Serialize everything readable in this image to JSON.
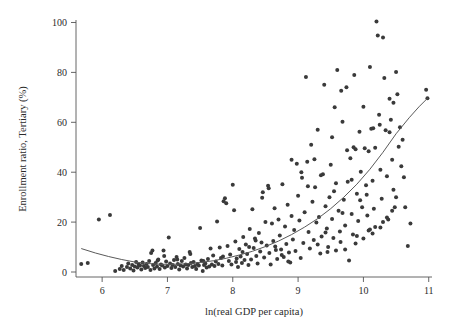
{
  "chart_data": {
    "type": "scatter",
    "title": "",
    "xlabel": "ln(real GDP per capita)",
    "ylabel": "Enrollment ratio, Tertiary (%)",
    "xlim": [
      5.6,
      11.05
    ],
    "ylim": [
      -2,
      101
    ],
    "xticks": [
      6,
      7,
      8,
      9,
      10,
      11
    ],
    "yticks": [
      0,
      20,
      40,
      60,
      80,
      100
    ],
    "xtick_labels": [
      "6",
      "7",
      "8",
      "9",
      "10",
      "11"
    ],
    "ytick_labels": [
      "0",
      "20",
      "40",
      "60",
      "80",
      "100"
    ],
    "grid": false,
    "legend": null,
    "marker_color": "#3a3a3a",
    "marker_size": 4,
    "fit_color": "#5a5a5a",
    "series": [
      {
        "name": "Countries",
        "points": [
          [
            5.68,
            3.2
          ],
          [
            5.78,
            3.6
          ],
          [
            5.95,
            21.0
          ],
          [
            6.12,
            22.8
          ],
          [
            6.2,
            0.4
          ],
          [
            6.27,
            1.2
          ],
          [
            6.3,
            2.4
          ],
          [
            6.33,
            0.8
          ],
          [
            6.38,
            2.0
          ],
          [
            6.4,
            3.4
          ],
          [
            6.43,
            1.4
          ],
          [
            6.46,
            2.8
          ],
          [
            6.48,
            0.6
          ],
          [
            6.5,
            2.2
          ],
          [
            6.52,
            4.0
          ],
          [
            6.54,
            1.8
          ],
          [
            6.56,
            3.0
          ],
          [
            6.58,
            2.6
          ],
          [
            6.6,
            1.0
          ],
          [
            6.62,
            3.8
          ],
          [
            6.64,
            2.4
          ],
          [
            6.66,
            1.6
          ],
          [
            6.68,
            3.2
          ],
          [
            6.7,
            2.0
          ],
          [
            6.72,
            4.4
          ],
          [
            6.74,
            0.8
          ],
          [
            6.75,
            7.6
          ],
          [
            6.77,
            8.6
          ],
          [
            6.78,
            2.8
          ],
          [
            6.8,
            1.4
          ],
          [
            6.82,
            3.6
          ],
          [
            6.84,
            2.2
          ],
          [
            6.86,
            5.0
          ],
          [
            6.88,
            1.2
          ],
          [
            6.9,
            3.0
          ],
          [
            6.92,
            2.6
          ],
          [
            6.94,
            8.6
          ],
          [
            6.96,
            1.8
          ],
          [
            6.98,
            4.2
          ],
          [
            7.0,
            2.4
          ],
          [
            7.02,
            13.8
          ],
          [
            7.04,
            3.4
          ],
          [
            7.06,
            1.6
          ],
          [
            7.08,
            2.8
          ],
          [
            7.1,
            4.8
          ],
          [
            7.12,
            2.0
          ],
          [
            7.14,
            6.0
          ],
          [
            7.16,
            3.2
          ],
          [
            7.18,
            1.0
          ],
          [
            7.2,
            2.6
          ],
          [
            7.22,
            4.4
          ],
          [
            7.24,
            2.2
          ],
          [
            7.26,
            5.6
          ],
          [
            7.28,
            3.0
          ],
          [
            7.3,
            1.4
          ],
          [
            7.32,
            2.8
          ],
          [
            7.34,
            8.0
          ],
          [
            7.36,
            3.6
          ],
          [
            7.38,
            2.0
          ],
          [
            7.4,
            4.0
          ],
          [
            7.42,
            2.4
          ],
          [
            7.44,
            1.2
          ],
          [
            7.46,
            3.2
          ],
          [
            7.48,
            2.6
          ],
          [
            7.5,
            17.6
          ],
          [
            7.52,
            4.6
          ],
          [
            7.54,
            0.4
          ],
          [
            7.56,
            2.8
          ],
          [
            7.58,
            3.4
          ],
          [
            7.6,
            1.8
          ],
          [
            7.62,
            5.2
          ],
          [
            7.64,
            2.2
          ],
          [
            7.66,
            9.4
          ],
          [
            7.68,
            3.0
          ],
          [
            7.7,
            6.6
          ],
          [
            7.72,
            2.4
          ],
          [
            7.74,
            4.2
          ],
          [
            7.76,
            20.2
          ],
          [
            7.78,
            3.2
          ],
          [
            7.8,
            9.8
          ],
          [
            7.82,
            5.6
          ],
          [
            7.84,
            2.6
          ],
          [
            7.86,
            28.4
          ],
          [
            7.88,
            29.6
          ],
          [
            7.9,
            27.6
          ],
          [
            7.92,
            10.4
          ],
          [
            7.94,
            4.4
          ],
          [
            7.96,
            7.0
          ],
          [
            7.98,
            3.0
          ],
          [
            8.0,
            35.0
          ],
          [
            8.02,
            24.8
          ],
          [
            8.04,
            12.2
          ],
          [
            8.06,
            5.4
          ],
          [
            8.08,
            2.0
          ],
          [
            8.1,
            9.2
          ],
          [
            8.12,
            6.2
          ],
          [
            8.14,
            3.6
          ],
          [
            8.16,
            14.0
          ],
          [
            8.18,
            4.8
          ],
          [
            8.2,
            11.0
          ],
          [
            8.22,
            7.2
          ],
          [
            8.24,
            2.8
          ],
          [
            8.26,
            17.2
          ],
          [
            8.28,
            5.0
          ],
          [
            8.3,
            25.2
          ],
          [
            8.32,
            9.6
          ],
          [
            8.34,
            13.4
          ],
          [
            8.36,
            6.4
          ],
          [
            8.38,
            3.4
          ],
          [
            8.4,
            15.6
          ],
          [
            8.42,
            8.2
          ],
          [
            8.44,
            11.8
          ],
          [
            8.46,
            32.0
          ],
          [
            8.48,
            5.8
          ],
          [
            8.5,
            20.0
          ],
          [
            8.52,
            10.6
          ],
          [
            8.54,
            34.6
          ],
          [
            8.56,
            7.6
          ],
          [
            8.58,
            3.0
          ],
          [
            8.6,
            19.4
          ],
          [
            8.62,
            12.4
          ],
          [
            8.64,
            25.6
          ],
          [
            8.66,
            8.8
          ],
          [
            8.68,
            5.2
          ],
          [
            8.7,
            21.0
          ],
          [
            8.72,
            14.6
          ],
          [
            8.74,
            9.0
          ],
          [
            8.76,
            35.2
          ],
          [
            8.78,
            6.0
          ],
          [
            8.8,
            18.2
          ],
          [
            8.82,
            11.2
          ],
          [
            8.84,
            27.0
          ],
          [
            8.86,
            7.8
          ],
          [
            8.88,
            3.8
          ],
          [
            8.9,
            22.4
          ],
          [
            8.92,
            13.0
          ],
          [
            8.94,
            16.8
          ],
          [
            8.96,
            8.4
          ],
          [
            8.98,
            43.4
          ],
          [
            9.0,
            30.6
          ],
          [
            9.02,
            20.6
          ],
          [
            9.04,
            5.6
          ],
          [
            9.06,
            37.8
          ],
          [
            9.08,
            11.6
          ],
          [
            9.1,
            24.0
          ],
          [
            9.12,
            78.2
          ],
          [
            9.14,
            44.2
          ],
          [
            9.16,
            16.0
          ],
          [
            9.18,
            9.4
          ],
          [
            9.2,
            51.0
          ],
          [
            9.22,
            28.2
          ],
          [
            9.24,
            12.8
          ],
          [
            9.26,
            34.0
          ],
          [
            9.28,
            19.8
          ],
          [
            9.3,
            57.0
          ],
          [
            9.32,
            22.0
          ],
          [
            9.34,
            7.4
          ],
          [
            9.36,
            14.2
          ],
          [
            9.38,
            39.2
          ],
          [
            9.4,
            75.0
          ],
          [
            9.42,
            26.4
          ],
          [
            9.44,
            17.4
          ],
          [
            9.46,
            10.0
          ],
          [
            9.48,
            30.0
          ],
          [
            9.5,
            43.0
          ],
          [
            9.52,
            21.2
          ],
          [
            9.54,
            13.6
          ],
          [
            9.56,
            66.0
          ],
          [
            9.58,
            35.6
          ],
          [
            9.6,
            81.0
          ],
          [
            9.62,
            24.6
          ],
          [
            9.64,
            16.2
          ],
          [
            9.66,
            72.6
          ],
          [
            9.68,
            60.2
          ],
          [
            9.7,
            29.0
          ],
          [
            9.72,
            18.6
          ],
          [
            9.74,
            74.0
          ],
          [
            9.76,
            36.2
          ],
          [
            9.78,
            4.6
          ],
          [
            9.8,
            45.6
          ],
          [
            9.82,
            23.2
          ],
          [
            9.84,
            15.0
          ],
          [
            9.86,
            79.0
          ],
          [
            9.88,
            49.2
          ],
          [
            9.9,
            31.4
          ],
          [
            9.92,
            20.4
          ],
          [
            9.94,
            56.2
          ],
          [
            9.96,
            40.2
          ],
          [
            9.98,
            26.0
          ],
          [
            10.0,
            66.2
          ],
          [
            10.02,
            49.6
          ],
          [
            10.04,
            34.8
          ],
          [
            10.06,
            22.6
          ],
          [
            10.08,
            16.6
          ],
          [
            10.1,
            82.2
          ],
          [
            10.12,
            57.4
          ],
          [
            10.14,
            36.6
          ],
          [
            10.16,
            25.4
          ],
          [
            10.18,
            18.0
          ],
          [
            10.2,
            100.4
          ],
          [
            10.22,
            94.8
          ],
          [
            10.24,
            63.0
          ],
          [
            10.26,
            41.0
          ],
          [
            10.28,
            29.4
          ],
          [
            10.3,
            94.0
          ],
          [
            10.32,
            77.8
          ],
          [
            10.34,
            56.8
          ],
          [
            10.36,
            38.4
          ],
          [
            10.38,
            21.0
          ],
          [
            10.4,
            69.4
          ],
          [
            10.42,
            61.0
          ],
          [
            10.44,
            45.0
          ],
          [
            10.46,
            33.0
          ],
          [
            10.48,
            26.0
          ],
          [
            10.5,
            80.2
          ],
          [
            10.52,
            71.2
          ],
          [
            10.54,
            50.2
          ],
          [
            10.56,
            58.0
          ],
          [
            10.58,
            42.4
          ],
          [
            10.6,
            53.0
          ],
          [
            10.62,
            38.0
          ],
          [
            10.64,
            26.0
          ],
          [
            10.68,
            10.4
          ],
          [
            10.72,
            19.4
          ],
          [
            10.96,
            73.0
          ],
          [
            10.98,
            69.6
          ],
          [
            8.9,
            45.0
          ],
          [
            9.05,
            40.0
          ],
          [
            9.35,
            38.8
          ],
          [
            9.55,
            32.4
          ],
          [
            9.75,
            48.8
          ],
          [
            9.85,
            50.0
          ],
          [
            9.95,
            28.8
          ],
          [
            10.05,
            31.0
          ],
          [
            10.15,
            57.6
          ],
          [
            10.25,
            59.0
          ],
          [
            8.45,
            29.8
          ],
          [
            8.55,
            33.6
          ],
          [
            8.65,
            10.2
          ],
          [
            8.75,
            6.8
          ],
          [
            8.85,
            4.2
          ],
          [
            9.45,
            8.0
          ],
          [
            9.65,
            12.0
          ],
          [
            9.9,
            14.4
          ],
          [
            10.1,
            17.0
          ],
          [
            10.3,
            20.0
          ],
          [
            7.85,
            6.2
          ],
          [
            8.05,
            4.0
          ],
          [
            8.15,
            8.0
          ],
          [
            8.25,
            10.0
          ],
          [
            8.35,
            12.6
          ],
          [
            6.85,
            4.6
          ],
          [
            6.95,
            6.4
          ],
          [
            7.15,
            5.0
          ],
          [
            7.35,
            7.2
          ],
          [
            7.55,
            4.4
          ],
          [
            9.15,
            34.4
          ],
          [
            9.25,
            45.2
          ],
          [
            9.52,
            54.0
          ],
          [
            9.68,
            23.6
          ],
          [
            9.82,
            37.0
          ],
          [
            10.08,
            48.4
          ],
          [
            10.18,
            49.8
          ],
          [
            10.4,
            56.0
          ],
          [
            10.46,
            67.8
          ],
          [
            10.5,
            30.0
          ],
          [
            9.3,
            11.0
          ],
          [
            9.42,
            15.8
          ],
          [
            9.58,
            8.6
          ],
          [
            9.72,
            9.0
          ],
          [
            9.88,
            11.4
          ],
          [
            10.0,
            13.4
          ],
          [
            10.14,
            15.4
          ],
          [
            10.26,
            17.8
          ],
          [
            10.36,
            21.8
          ],
          [
            10.44,
            24.6
          ]
        ]
      }
    ],
    "fit_curve": {
      "name": "quadratic fit",
      "points": [
        [
          5.68,
          9.4
        ],
        [
          5.9,
          7.6
        ],
        [
          6.1,
          6.2
        ],
        [
          6.3,
          5.0
        ],
        [
          6.5,
          4.0
        ],
        [
          6.7,
          3.4
        ],
        [
          6.9,
          3.1
        ],
        [
          7.1,
          3.1
        ],
        [
          7.3,
          3.3
        ],
        [
          7.5,
          3.8
        ],
        [
          7.7,
          4.5
        ],
        [
          7.9,
          5.5
        ],
        [
          8.1,
          6.8
        ],
        [
          8.3,
          8.3
        ],
        [
          8.5,
          10.2
        ],
        [
          8.7,
          12.4
        ],
        [
          8.9,
          15.0
        ],
        [
          9.1,
          18.0
        ],
        [
          9.3,
          21.4
        ],
        [
          9.5,
          25.4
        ],
        [
          9.7,
          30.0
        ],
        [
          9.9,
          35.2
        ],
        [
          10.1,
          41.2
        ],
        [
          10.3,
          48.0
        ],
        [
          10.5,
          55.4
        ],
        [
          10.7,
          61.8
        ],
        [
          10.85,
          66.2
        ],
        [
          10.98,
          69.6
        ]
      ]
    }
  }
}
